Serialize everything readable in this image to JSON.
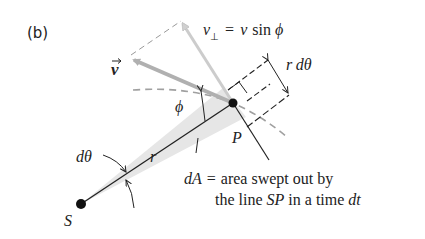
{
  "panel_label": "(b)",
  "labels": {
    "v_vec": "v",
    "v_perp_lhs": "v",
    "v_perp_sub": "⊥",
    "v_perp_eq": "=",
    "v_perp_rhs_v": "v",
    "v_perp_rhs_sin": "sin",
    "v_perp_rhs_phi": "ϕ",
    "r_dtheta_r": "r",
    "r_dtheta_d": "dθ",
    "phi": "ϕ",
    "P": "P",
    "r": "r",
    "dtheta": "dθ",
    "S": "S",
    "dA": "dA",
    "dA_eq": "=",
    "caption_line1": "area swept out by",
    "caption_line2_a": "the line",
    "caption_line2_sp": "SP",
    "caption_line2_b": "in a time",
    "caption_line2_dt": "dt"
  },
  "colors": {
    "line": "#222222",
    "vector_gray": "#b0b0b0",
    "vector_light": "#c8c8c8",
    "dashed": "#9a9a9a",
    "swept_area": "#e6e6e6",
    "point": "#111111"
  }
}
